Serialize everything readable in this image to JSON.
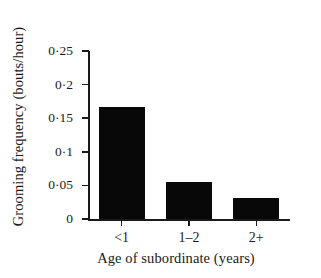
{
  "chart_data": {
    "type": "bar",
    "title": "",
    "xlabel": "Age of subordinate (years)",
    "ylabel": "Grooming frequency (bouts/hour)",
    "categories": [
      "<1",
      "1–2",
      "2+"
    ],
    "values": [
      0.166,
      0.055,
      0.032
    ],
    "ylim": [
      0,
      0.25
    ],
    "yticks": [
      0,
      0.05,
      0.1,
      0.15,
      0.2,
      0.25
    ],
    "ytick_labels": [
      "0",
      "0·05",
      "0·1",
      "0·15",
      "0·2",
      "0·25"
    ],
    "grid": false,
    "legend": null,
    "bar_color": "#080808",
    "axis_color": "#1a1a1a",
    "background_color": "#ffffff"
  }
}
